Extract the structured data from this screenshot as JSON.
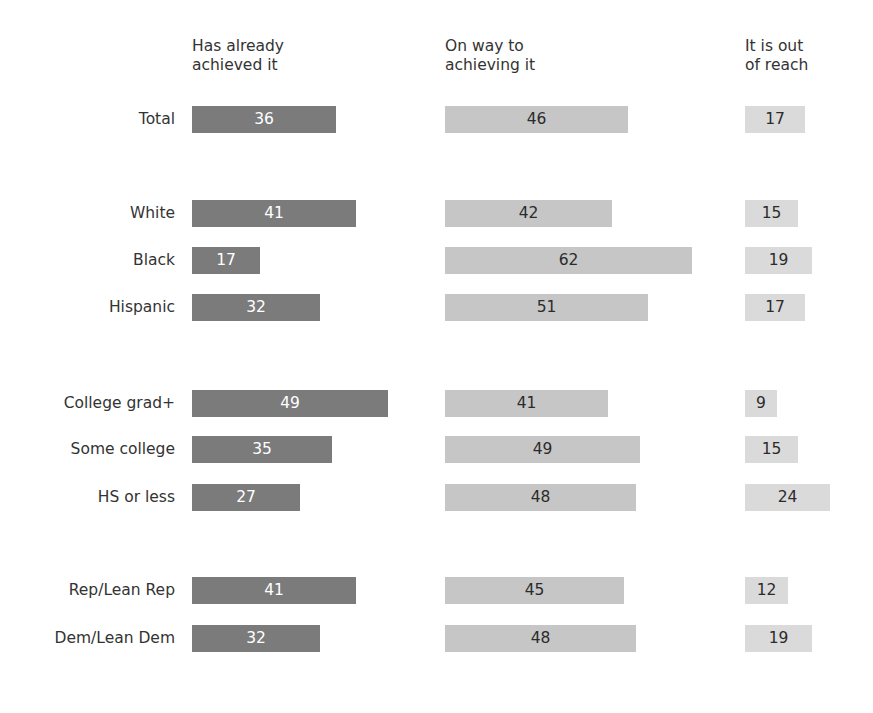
{
  "chart_data": {
    "type": "bar",
    "orientation": "horizontal",
    "title": "",
    "subtitle": "",
    "xlabel": "",
    "ylabel": "",
    "grid": false,
    "legend_position": "none",
    "value_labels": true,
    "note": "Grouped horizontal bar panels; each response option is its own column panel sharing the same category rows.",
    "columns": [
      {
        "label": "Has already\nachieved it",
        "color": "#7b7b7b",
        "label_color": "#ffffff"
      },
      {
        "label": "On way to\nachieving it",
        "color": "#c6c6c6",
        "label_color": "#2b2b2b"
      },
      {
        "label": "It is out\nof reach",
        "color": "#dadada",
        "label_color": "#2b2b2b"
      }
    ],
    "categories": [
      "Total",
      "White",
      "Black",
      "Hispanic",
      "College grad+",
      "Some college",
      "HS or less",
      "Rep/Lean Rep",
      "Dem/Lean Dem"
    ],
    "category_groups": [
      {
        "name": "",
        "categories": [
          "Total"
        ]
      },
      {
        "name": "",
        "categories": [
          "White",
          "Black",
          "Hispanic"
        ]
      },
      {
        "name": "",
        "categories": [
          "College grad+",
          "Some college",
          "HS or less"
        ]
      },
      {
        "name": "",
        "categories": [
          "Rep/Lean Rep",
          "Dem/Lean Dem"
        ]
      }
    ],
    "series": [
      {
        "name": "Has already achieved it",
        "values": [
          36,
          41,
          17,
          32,
          49,
          35,
          27,
          41,
          32
        ]
      },
      {
        "name": "On way to achieving it",
        "values": [
          46,
          42,
          62,
          51,
          41,
          49,
          48,
          45,
          48
        ]
      },
      {
        "name": "It is out of reach",
        "values": [
          17,
          15,
          19,
          17,
          9,
          15,
          24,
          12,
          19
        ]
      }
    ],
    "xlim": [
      0,
      62
    ],
    "units": "percent"
  },
  "rows": [
    {
      "label": "Total",
      "top": 104,
      "values": [
        36,
        46,
        17
      ]
    },
    {
      "label": "White",
      "top": 198,
      "values": [
        41,
        42,
        15
      ]
    },
    {
      "label": "Black",
      "top": 245,
      "values": [
        17,
        62,
        19
      ]
    },
    {
      "label": "Hispanic",
      "top": 292,
      "values": [
        32,
        51,
        17
      ]
    },
    {
      "label": "College grad+",
      "top": 388,
      "values": [
        49,
        41,
        9
      ]
    },
    {
      "label": "Some college",
      "top": 434,
      "values": [
        35,
        49,
        15
      ]
    },
    {
      "label": "HS or less",
      "top": 482,
      "values": [
        27,
        48,
        24
      ]
    },
    {
      "label": "Rep/Lean Rep",
      "top": 575,
      "values": [
        41,
        45,
        12
      ]
    },
    {
      "label": "Dem/Lean Dem",
      "top": 623,
      "values": [
        32,
        48,
        19
      ]
    }
  ],
  "layout": {
    "column_x": [
      192,
      445,
      745
    ],
    "px_per_unit": [
      4.0,
      3.98,
      3.55
    ],
    "bar_height": 27
  },
  "colors": {
    "background": "#ffffff",
    "text": "#333333",
    "bar_dark": "#7b7b7b",
    "bar_medium": "#c6c6c6",
    "bar_light": "#dadada"
  }
}
